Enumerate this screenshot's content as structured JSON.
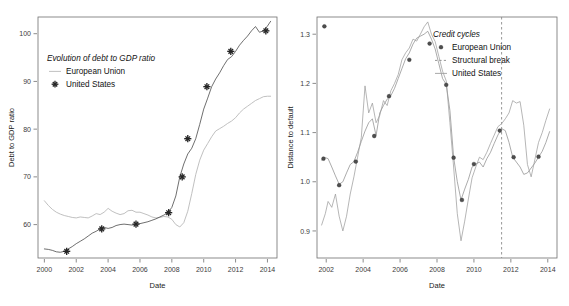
{
  "figure": {
    "width": 569,
    "height": 306,
    "background": "#ffffff"
  },
  "chart_data": [
    {
      "id": "left-panel",
      "type": "line",
      "title": "Evolution of debt to GDP ratio",
      "xlabel": "Date",
      "ylabel": "Debt to GDP ratio",
      "xlim": [
        1999.6,
        2014.6
      ],
      "ylim": [
        53.0,
        103.5
      ],
      "xticks": [
        2000,
        2002,
        2004,
        2006,
        2008,
        2010,
        2012,
        2014
      ],
      "xticklabels": [
        "2000",
        "2002",
        "2004",
        "2006",
        "2008",
        "2010",
        "2012",
        "2014"
      ],
      "yticks": [
        60,
        70,
        80,
        90,
        100
      ],
      "yticklabels": [
        "60",
        "70",
        "80",
        "90",
        "100"
      ],
      "grid": false,
      "legend_position": "upper-left-inside",
      "legend": [
        {
          "label": "European Union",
          "marker": "line",
          "color": "#b9b9b9"
        },
        {
          "label": "United States",
          "marker": "plus",
          "color": "#262626"
        }
      ],
      "series": [
        {
          "name": "European Union",
          "color": "#b9b9b9",
          "marker": "none",
          "x": [
            2000.0,
            2000.25,
            2000.5,
            2000.75,
            2001.0,
            2001.25,
            2001.5,
            2001.75,
            2002.0,
            2002.25,
            2002.5,
            2002.75,
            2003.0,
            2003.25,
            2003.5,
            2003.75,
            2004.0,
            2004.25,
            2004.5,
            2004.75,
            2005.0,
            2005.25,
            2005.5,
            2005.75,
            2006.0,
            2006.25,
            2006.5,
            2006.75,
            2007.0,
            2007.25,
            2007.5,
            2007.75,
            2008.0,
            2008.25,
            2008.5,
            2008.75,
            2009.0,
            2009.25,
            2009.5,
            2009.75,
            2010.0,
            2010.25,
            2010.5,
            2010.75,
            2011.0,
            2011.25,
            2011.5,
            2011.75,
            2012.0,
            2012.25,
            2012.5,
            2012.75,
            2013.0,
            2013.25,
            2013.5,
            2013.75,
            2014.0,
            2014.2
          ],
          "y": [
            65.0,
            64.0,
            63.2,
            62.6,
            62.2,
            61.9,
            61.7,
            61.5,
            61.4,
            61.6,
            61.5,
            61.4,
            61.8,
            62.3,
            62.1,
            62.6,
            63.4,
            62.8,
            62.4,
            62.1,
            62.3,
            62.9,
            63.0,
            62.6,
            62.6,
            62.3,
            62.0,
            61.6,
            61.4,
            61.5,
            61.7,
            61.6,
            61.1,
            60.0,
            59.5,
            60.4,
            62.8,
            66.5,
            70.5,
            73.5,
            75.6,
            77.0,
            78.4,
            79.6,
            80.1,
            80.6,
            81.2,
            81.7,
            82.4,
            83.4,
            84.2,
            84.8,
            85.4,
            86.0,
            86.4,
            86.8,
            86.9,
            86.9
          ]
        },
        {
          "name": "United States",
          "color": "#4a4a4a",
          "marker": "plus",
          "x": [
            2000.0,
            2000.25,
            2000.5,
            2000.75,
            2001.0,
            2001.25,
            2001.5,
            2001.75,
            2002.0,
            2002.25,
            2002.5,
            2002.75,
            2003.0,
            2003.25,
            2003.5,
            2003.75,
            2004.0,
            2004.25,
            2004.5,
            2004.75,
            2005.0,
            2005.25,
            2005.5,
            2005.75,
            2006.0,
            2006.25,
            2006.5,
            2006.75,
            2007.0,
            2007.25,
            2007.5,
            2007.75,
            2008.0,
            2008.25,
            2008.5,
            2008.75,
            2009.0,
            2009.25,
            2009.5,
            2009.75,
            2010.0,
            2010.25,
            2010.5,
            2010.75,
            2011.0,
            2011.25,
            2011.5,
            2011.75,
            2012.0,
            2012.25,
            2012.5,
            2012.75,
            2013.0,
            2013.25,
            2013.5,
            2013.75,
            2014.0,
            2014.2
          ],
          "y": [
            54.9,
            54.8,
            54.6,
            54.3,
            54.2,
            54.4,
            54.9,
            55.4,
            56.0,
            56.5,
            57.0,
            57.6,
            58.2,
            58.6,
            59.1,
            59.4,
            59.2,
            59.4,
            59.8,
            60.0,
            60.1,
            60.0,
            59.9,
            60.1,
            60.2,
            60.4,
            60.6,
            60.9,
            61.2,
            61.6,
            62.0,
            62.5,
            63.6,
            66.0,
            70.0,
            72.7,
            74.8,
            76.0,
            78.0,
            81.0,
            84.2,
            86.5,
            88.9,
            90.5,
            91.8,
            93.3,
            94.6,
            95.2,
            96.3,
            97.6,
            98.6,
            99.5,
            100.6,
            101.5,
            100.3,
            100.6,
            101.6,
            102.6
          ]
        }
      ],
      "markers": {
        "series": "United States",
        "points": [
          {
            "x": 2001.4,
            "y": 54.4
          },
          {
            "x": 2003.6,
            "y": 59.1
          },
          {
            "x": 2005.75,
            "y": 60.1
          },
          {
            "x": 2007.8,
            "y": 62.5
          },
          {
            "x": 2008.65,
            "y": 70.0
          },
          {
            "x": 2009.0,
            "y": 78.0
          },
          {
            "x": 2010.2,
            "y": 88.9
          },
          {
            "x": 2011.7,
            "y": 96.3
          },
          {
            "x": 2013.9,
            "y": 100.6
          }
        ]
      }
    },
    {
      "id": "right-panel",
      "type": "line",
      "title": "Credit cycles",
      "xlabel": "Date",
      "ylabel": "Distance to default",
      "xlim": [
        2001.5,
        2014.5
      ],
      "ylim": [
        0.845,
        1.335
      ],
      "xticks": [
        2002,
        2004,
        2006,
        2008,
        2010,
        2012,
        2014
      ],
      "xticklabels": [
        "2002",
        "2004",
        "2006",
        "2008",
        "2010",
        "2012",
        "2014"
      ],
      "yticks": [
        0.9,
        1.0,
        1.1,
        1.2,
        1.3
      ],
      "yticklabels": [
        "0.9",
        "1.0",
        "1.1",
        "1.2",
        "1.3"
      ],
      "grid": false,
      "legend_position": "upper-right-inside",
      "legend": [
        {
          "label": "European Union",
          "marker": "dot",
          "color": "#4e4e4e"
        },
        {
          "label": "Structural break",
          "marker": "dashed-line",
          "color": "#8a8a8a"
        },
        {
          "label": "United States",
          "marker": "line",
          "color": "#9e9e9e"
        }
      ],
      "annotations": [
        {
          "type": "vline",
          "name": "structural-break",
          "x": 2011.5,
          "style": "dashed",
          "color": "#8a8a8a"
        }
      ],
      "series": [
        {
          "name": "European Union",
          "color": "#8f8f8f",
          "marker": "dot",
          "x": [
            2001.75,
            2001.95,
            2002.1,
            2002.3,
            2002.5,
            2002.7,
            2002.9,
            2003.1,
            2003.3,
            2003.5,
            2003.7,
            2003.9,
            2004.1,
            2004.3,
            2004.5,
            2004.7,
            2004.9,
            2005.1,
            2005.3,
            2005.5,
            2005.7,
            2005.9,
            2006.1,
            2006.3,
            2006.5,
            2006.7,
            2006.9,
            2007.1,
            2007.3,
            2007.5,
            2007.7,
            2007.9,
            2008.1,
            2008.3,
            2008.5,
            2008.7,
            2008.9,
            2009.1,
            2009.3,
            2009.5,
            2009.7,
            2009.9,
            2010.1,
            2010.3,
            2010.5,
            2010.7,
            2010.9,
            2011.1,
            2011.3,
            2011.5,
            2011.7,
            2011.9,
            2012.1,
            2012.3,
            2012.5,
            2012.7,
            2012.9,
            2013.1,
            2013.3,
            2013.5,
            2013.7,
            2013.9,
            2014.1
          ],
          "y": [
            1.044,
            1.049,
            1.047,
            1.03,
            1.012,
            0.995,
            1.0,
            1.018,
            1.035,
            1.041,
            1.06,
            1.082,
            1.103,
            1.12,
            1.128,
            1.094,
            1.14,
            1.155,
            1.168,
            1.175,
            1.19,
            1.21,
            1.23,
            1.25,
            1.262,
            1.28,
            1.292,
            1.296,
            1.3,
            1.306,
            1.29,
            1.27,
            1.24,
            1.21,
            1.198,
            1.145,
            1.05,
            1.0,
            0.963,
            0.985,
            1.005,
            1.03,
            1.036,
            1.04,
            1.03,
            1.047,
            1.06,
            1.078,
            1.095,
            1.108,
            1.104,
            1.08,
            1.05,
            1.04,
            1.03,
            1.015,
            1.018,
            1.028,
            1.038,
            1.05,
            1.062,
            1.08,
            1.102
          ]
        },
        {
          "name": "United States",
          "color": "#9e9e9e",
          "marker": "none",
          "x": [
            2001.75,
            2001.95,
            2002.1,
            2002.3,
            2002.5,
            2002.7,
            2002.9,
            2003.1,
            2003.3,
            2003.5,
            2003.7,
            2003.9,
            2004.1,
            2004.3,
            2004.5,
            2004.7,
            2004.9,
            2005.1,
            2005.3,
            2005.5,
            2005.7,
            2005.9,
            2006.1,
            2006.3,
            2006.5,
            2006.7,
            2006.9,
            2007.1,
            2007.3,
            2007.5,
            2007.7,
            2007.9,
            2008.1,
            2008.3,
            2008.5,
            2008.7,
            2008.9,
            2009.1,
            2009.3,
            2009.5,
            2009.7,
            2009.9,
            2010.1,
            2010.3,
            2010.5,
            2010.7,
            2010.9,
            2011.1,
            2011.3,
            2011.5,
            2011.7,
            2011.9,
            2012.1,
            2012.3,
            2012.5,
            2012.7,
            2012.9,
            2013.1,
            2013.3,
            2013.5,
            2013.7,
            2013.9,
            2014.1
          ],
          "y": [
            0.912,
            0.935,
            0.96,
            0.948,
            0.975,
            0.93,
            0.9,
            0.93,
            0.975,
            1.01,
            1.05,
            1.09,
            1.195,
            1.14,
            1.16,
            1.12,
            1.135,
            1.165,
            1.155,
            1.185,
            1.2,
            1.218,
            1.248,
            1.262,
            1.272,
            1.29,
            1.286,
            1.3,
            1.315,
            1.325,
            1.3,
            1.285,
            1.255,
            1.225,
            1.205,
            1.12,
            1.03,
            0.935,
            0.88,
            0.92,
            0.965,
            1.008,
            1.03,
            1.05,
            1.045,
            1.06,
            1.078,
            1.095,
            1.112,
            1.118,
            1.128,
            1.14,
            1.165,
            1.16,
            1.163,
            1.115,
            1.035,
            1.01,
            1.045,
            1.08,
            1.1,
            1.125,
            1.148
          ]
        }
      ],
      "markers": {
        "series": "European Union",
        "points": [
          {
            "x": 2001.9,
            "y": 1.316
          },
          {
            "x": 2001.85,
            "y": 1.047
          },
          {
            "x": 2002.7,
            "y": 0.993
          },
          {
            "x": 2003.6,
            "y": 1.041
          },
          {
            "x": 2004.6,
            "y": 1.093
          },
          {
            "x": 2005.4,
            "y": 1.174
          },
          {
            "x": 2006.5,
            "y": 1.248
          },
          {
            "x": 2007.6,
            "y": 1.281
          },
          {
            "x": 2008.5,
            "y": 1.197
          },
          {
            "x": 2008.9,
            "y": 1.049
          },
          {
            "x": 2009.35,
            "y": 0.963
          },
          {
            "x": 2010.0,
            "y": 1.036
          },
          {
            "x": 2011.4,
            "y": 1.104
          },
          {
            "x": 2012.15,
            "y": 1.05
          },
          {
            "x": 2013.5,
            "y": 1.051
          }
        ]
      }
    }
  ]
}
